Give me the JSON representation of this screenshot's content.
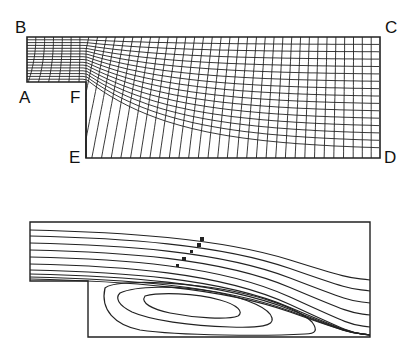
{
  "figure": {
    "top_panel": {
      "description": "Computational mesh for backward-facing step channel",
      "corner_labels": {
        "A": "A",
        "B": "B",
        "C": "C",
        "D": "D",
        "E": "E",
        "F": "F"
      }
    },
    "bottom_panel": {
      "description": "Streamline contours with recirculation zone behind step"
    }
  }
}
